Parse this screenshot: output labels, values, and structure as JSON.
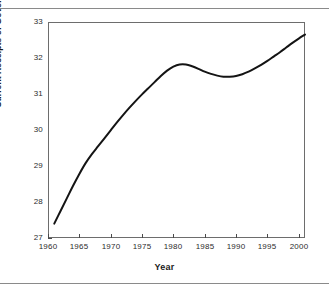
{
  "chart_data": {
    "type": "line",
    "title": "",
    "xlabel": "Year",
    "ylabel": "Current Receipts of Government/GDP",
    "xlim": [
      1960,
      2001
    ],
    "ylim": [
      27,
      33
    ],
    "grid": false,
    "legend": null,
    "line_color": "#141414",
    "xticks": [
      1960,
      1965,
      1970,
      1975,
      1980,
      1985,
      1990,
      1995,
      2000
    ],
    "xtick_labels": [
      "1960",
      "1965",
      "1970",
      "1975",
      "1980",
      "1985",
      "1990",
      "1995",
      "2000"
    ],
    "yticks": [
      27,
      28,
      29,
      30,
      31,
      32,
      33
    ],
    "ytick_labels": [
      "27",
      "28",
      "29",
      "30",
      "31",
      "32",
      "33"
    ],
    "series": [
      {
        "name": "Current Receipts of Government/GDP",
        "x": [
          1961,
          1962,
          1963,
          1964,
          1965,
          1966,
          1967,
          1968,
          1969,
          1970,
          1971,
          1972,
          1973,
          1974,
          1975,
          1976,
          1977,
          1978,
          1979,
          1980,
          1981,
          1982,
          1983,
          1984,
          1985,
          1986,
          1987,
          1988,
          1989,
          1990,
          1991,
          1992,
          1993,
          1994,
          1995,
          1996,
          1997,
          1998,
          1999,
          2000,
          2001
        ],
        "values": [
          27.4,
          27.75,
          28.1,
          28.45,
          28.78,
          29.08,
          29.33,
          29.55,
          29.77,
          29.99,
          30.21,
          30.42,
          30.62,
          30.81,
          30.99,
          31.16,
          31.33,
          31.5,
          31.65,
          31.76,
          31.82,
          31.82,
          31.77,
          31.7,
          31.62,
          31.56,
          31.51,
          31.48,
          31.48,
          31.5,
          31.55,
          31.62,
          31.71,
          31.81,
          31.92,
          32.04,
          32.16,
          32.29,
          32.42,
          32.54,
          32.65
        ]
      }
    ],
    "annotations": {
      "start_value": 27.4,
      "start_year": 1961,
      "peak_value": 31.82,
      "peak_year": 1981,
      "local_min_value": 31.48,
      "local_min_year": 1989,
      "end_value": 32.65,
      "end_year": 2001
    }
  }
}
